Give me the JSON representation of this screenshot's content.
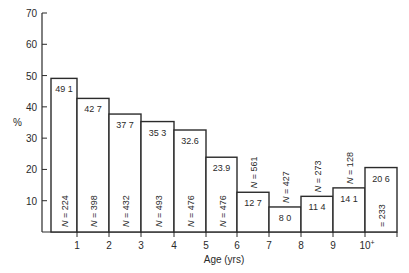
{
  "chart_data": {
    "type": "bar",
    "title": "",
    "xlabel": "Age (yrs)",
    "ylabel": "%",
    "ylim": [
      0,
      70
    ],
    "yticks": [
      10,
      20,
      30,
      40,
      50,
      60,
      70
    ],
    "grid": false,
    "legend": null,
    "categories": [
      "0-1",
      "1-2",
      "2-3",
      "3-4",
      "4-5",
      "5-6",
      "6-7",
      "7-8",
      "8-9",
      "9-10",
      "10+"
    ],
    "xtick_labels": [
      "1",
      "2",
      "3",
      "4",
      "5",
      "6",
      "7",
      "8",
      "9",
      "10+"
    ],
    "values": [
      49.1,
      42.7,
      37.7,
      35.3,
      32.6,
      23.9,
      12.7,
      8.0,
      11.4,
      14.1,
      20.6
    ],
    "value_labels": [
      "49 1",
      "42 7",
      "37 7",
      "35 3",
      "32.6",
      "23.9",
      "12 7",
      "8 0",
      "11 4",
      "14 1",
      "20 6"
    ],
    "sample_sizes": [
      224,
      398,
      432,
      493,
      476,
      476,
      561,
      427,
      273,
      128,
      233
    ],
    "n_labels": [
      "N = 224",
      "N = 398",
      "N = 432",
      "N = 493",
      "N = 476",
      "N = 476",
      "N = 561",
      "N = 427",
      "N = 273",
      "N = 128",
      "= 233"
    ]
  }
}
